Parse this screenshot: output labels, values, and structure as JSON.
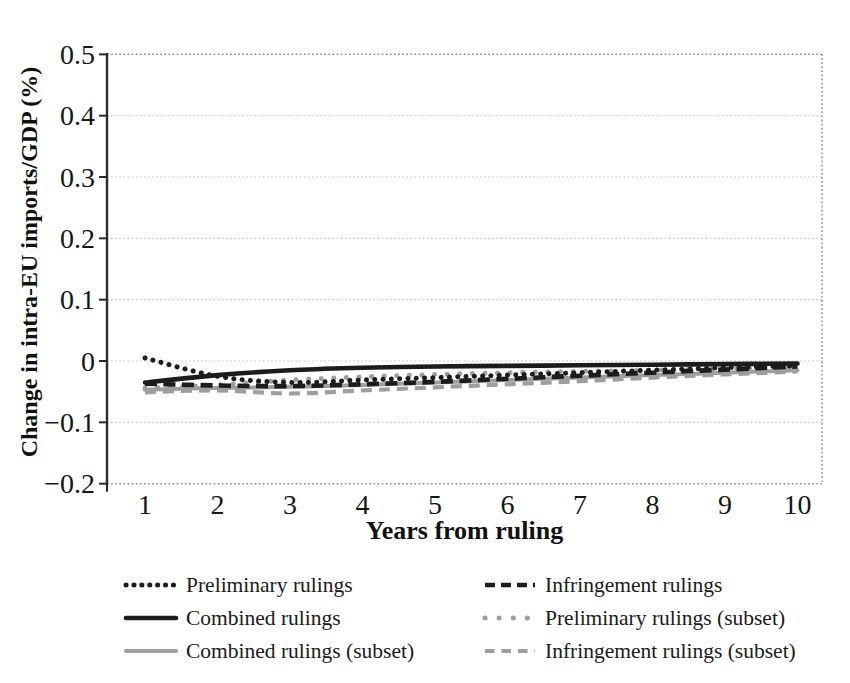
{
  "figure": {
    "background": "#ffffff"
  },
  "chart_data": {
    "type": "line",
    "title": "",
    "xlabel": "Years from ruling",
    "ylabel": "Change in intra-EU imports/GDP (%)",
    "x": [
      1,
      2,
      3,
      4,
      5,
      6,
      7,
      8,
      9,
      10
    ],
    "xtick_labels": [
      "1",
      "2",
      "3",
      "4",
      "5",
      "6",
      "7",
      "8",
      "9",
      "10"
    ],
    "xlim": [
      0.48,
      10.45
    ],
    "ylim": [
      -0.2,
      0.5
    ],
    "yticks": [
      0.5,
      0.4,
      0.3,
      0.2,
      0.1,
      0,
      -0.1,
      -0.2
    ],
    "ytick_labels": [
      "0.5",
      "0.4",
      "0.3",
      "0.2",
      "0.1",
      "0",
      "−0.1",
      "−0.2"
    ],
    "grid": "horizontal-dotted",
    "plot_border": "dotted-top-right-bottom, solid-left-axis",
    "legend_position": "bottom-two-columns",
    "colors": {
      "black_series": "#1c1c1c",
      "gray_series": "#9e9e9e",
      "axis": "#2a2a2a",
      "border": "#8f8f8f",
      "grid": "#c4c4c4",
      "text": "#161616"
    },
    "series": [
      {
        "id": "preliminary",
        "name": "Preliminary rulings",
        "color": "#1c1c1c",
        "pattern": "dotted-dense",
        "values": [
          0.005,
          -0.025,
          -0.035,
          -0.031,
          -0.027,
          -0.023,
          -0.019,
          -0.015,
          -0.011,
          -0.008
        ]
      },
      {
        "id": "infringement",
        "name": "Infringement rulings",
        "color": "#1c1c1c",
        "pattern": "dashed",
        "values": [
          -0.037,
          -0.04,
          -0.041,
          -0.038,
          -0.034,
          -0.029,
          -0.024,
          -0.019,
          -0.014,
          -0.009
        ]
      },
      {
        "id": "combined",
        "name": "Combined rulings",
        "color": "#1c1c1c",
        "pattern": "solid",
        "values": [
          -0.035,
          -0.023,
          -0.015,
          -0.011,
          -0.009,
          -0.008,
          -0.007,
          -0.006,
          -0.005,
          -0.004
        ]
      },
      {
        "id": "preliminary-subset",
        "name": "Preliminary rulings (subset)",
        "color": "#9e9e9e",
        "pattern": "dotted-sparse",
        "values": [
          -0.044,
          -0.039,
          -0.031,
          -0.026,
          -0.022,
          -0.019,
          -0.017,
          -0.015,
          -0.013,
          -0.011
        ]
      },
      {
        "id": "combined-subset",
        "name": "Combined rulings (subset)",
        "color": "#9e9e9e",
        "pattern": "solid-thin",
        "values": [
          -0.047,
          -0.044,
          -0.042,
          -0.039,
          -0.035,
          -0.031,
          -0.027,
          -0.023,
          -0.019,
          -0.015
        ]
      },
      {
        "id": "infringement-subset",
        "name": "Infringement rulings (subset)",
        "color": "#9e9e9e",
        "pattern": "dashed-thin",
        "values": [
          -0.051,
          -0.048,
          -0.053,
          -0.048,
          -0.043,
          -0.038,
          -0.033,
          -0.027,
          -0.022,
          -0.017
        ]
      }
    ]
  },
  "legend": {
    "columns": [
      [
        "preliminary",
        "combined",
        "combined-subset"
      ],
      [
        "infringement",
        "preliminary-subset",
        "infringement-subset"
      ]
    ]
  }
}
